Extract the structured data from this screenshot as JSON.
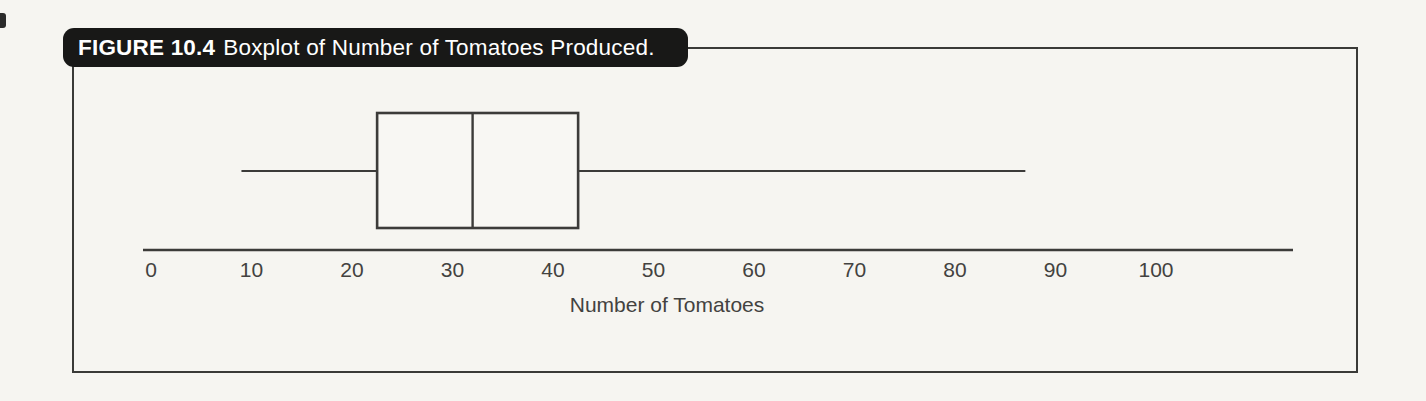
{
  "figure": {
    "label": "FIGURE 10.4",
    "caption": "Boxplot of Number of Tomatoes Produced.",
    "banner_bg": "#181817",
    "banner_text_color": "#ffffff",
    "frame_border_color": "#3a3a38"
  },
  "chart_data": {
    "type": "boxplot",
    "orientation": "horizontal",
    "title": "Boxplot of Number of Tomatoes Produced.",
    "xlabel": "Number of Tomatoes",
    "x_ticks": [
      0,
      10,
      20,
      30,
      40,
      50,
      60,
      70,
      80,
      90,
      100
    ],
    "xlim": [
      -1,
      114
    ],
    "grid": false,
    "legend": false,
    "line_color": "#3c3b39",
    "text_color": "#434240",
    "series": [
      {
        "name": "Number of Tomatoes",
        "min": 9,
        "q1": 22.5,
        "median": 32,
        "q3": 42.5,
        "max": 87,
        "outliers": []
      }
    ]
  }
}
